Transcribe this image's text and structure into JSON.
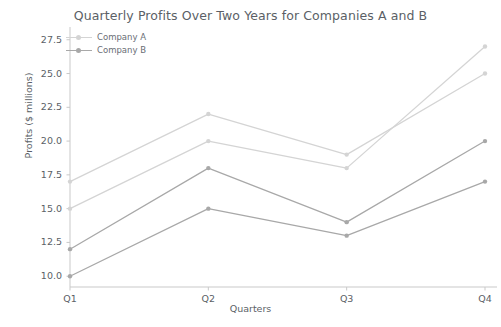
{
  "chart_data": {
    "type": "line",
    "title": "Quarterly Profits Over Two Years for Companies A and B",
    "xlabel": "Quarters",
    "ylabel": "Profits ($ millions)",
    "categories": [
      "Q1",
      "Q2",
      "Q3",
      "Q4"
    ],
    "xtick_labels": [
      "Q1",
      "Q2",
      "Q3",
      "Q4"
    ],
    "ytick_labels": [
      "10.0",
      "12.5",
      "15.0",
      "17.5",
      "20.0",
      "22.5",
      "25.0",
      "27.5"
    ],
    "ytick_values": [
      10.0,
      12.5,
      15.0,
      17.5,
      20.0,
      22.5,
      25.0,
      27.5
    ],
    "ylim": [
      9.2,
      28.0
    ],
    "grid": false,
    "legend_position": "upper-left",
    "legend_entries": [
      "Company A",
      "Company B"
    ],
    "series": [
      {
        "name": "Company A",
        "sublabel": "Company A - Year 1",
        "color": "#d4d4d4",
        "marker": "circle",
        "values": [
          17.0,
          22.0,
          19.0,
          25.0
        ]
      },
      {
        "name": "Company A",
        "sublabel": "Company A - Year 2",
        "color": "#d4d4d4",
        "marker": "circle",
        "values": [
          15.0,
          20.0,
          18.0,
          27.0
        ]
      },
      {
        "name": "Company B",
        "sublabel": "Company B - Year 1",
        "color": "#a8a8a8",
        "marker": "circle",
        "values": [
          12.0,
          18.0,
          14.0,
          20.0
        ]
      },
      {
        "name": "Company B",
        "sublabel": "Company B - Year 2",
        "color": "#a8a8a8",
        "marker": "circle",
        "values": [
          10.0,
          15.0,
          13.0,
          17.0
        ]
      }
    ]
  },
  "style": {
    "background": "#ffffff",
    "axis_color": "#c9c9c9",
    "text_color": "#5b5f66",
    "legend_text_color": "#6a6e75",
    "series_a_color": "#d4d4d4",
    "series_b_color": "#a8a8a8"
  }
}
